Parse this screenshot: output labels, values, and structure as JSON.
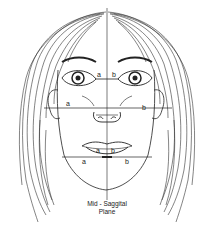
{
  "diagram": {
    "caption_line1": "Mid - Saggital",
    "caption_line2": "Plane",
    "measurements": [
      {
        "level": "eyes",
        "left_label": "a",
        "right_label": "b"
      },
      {
        "level": "cheeks",
        "left_label": "a",
        "right_label": "b"
      },
      {
        "level": "lips",
        "left_label": "a",
        "right_label": "b"
      },
      {
        "level": "jaw",
        "left_label": "a",
        "right_label": "b"
      }
    ],
    "colors": {
      "line": "#222222",
      "background": "#ffffff"
    }
  }
}
